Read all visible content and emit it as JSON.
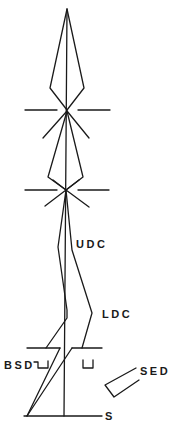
{
  "diagram": {
    "type": "electron-optics-column-schematic",
    "stroke_color": "#1a1a1a",
    "background": "#ffffff",
    "labels": {
      "udc": "UDC",
      "ldc": "LDC",
      "bsd": "BSD",
      "sed": "SED",
      "specimen": "S"
    },
    "components": [
      {
        "id": "upper-beam-cone",
        "description": "upper diamond-shaped beam envelope"
      },
      {
        "id": "upper-lens-plane",
        "description": "upper focal plane with star crossover"
      },
      {
        "id": "lower-beam-cone",
        "description": "lower diamond-shaped beam envelope"
      },
      {
        "id": "lower-lens-plane",
        "description": "lower focal plane with star crossover"
      },
      {
        "id": "udc",
        "description": "upper detector channel path"
      },
      {
        "id": "ldc",
        "description": "lower detector channel path"
      },
      {
        "id": "objective-plate",
        "description": "horizontal pole-piece plate"
      },
      {
        "id": "bsd",
        "description": "backscatter detector brackets"
      },
      {
        "id": "sed",
        "description": "secondary electron detector"
      },
      {
        "id": "specimen",
        "description": "specimen base line S"
      }
    ]
  }
}
